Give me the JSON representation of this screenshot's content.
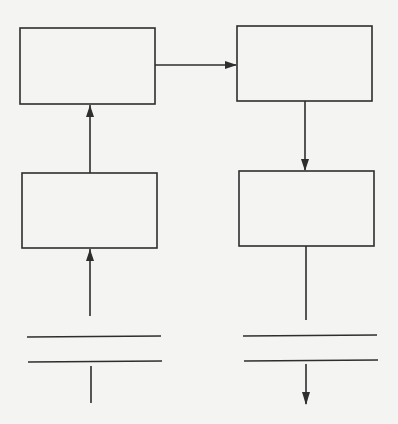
{
  "diagram": {
    "type": "block-flow",
    "stroke_color": "#2e2e2e",
    "background_color": "#f4f4f3",
    "blocks": [
      {
        "id": "block-top-left",
        "label": "",
        "x": 20,
        "y": 28,
        "w": 135,
        "h": 76
      },
      {
        "id": "block-top-right",
        "label": "",
        "x": 237,
        "y": 26,
        "w": 135,
        "h": 75
      },
      {
        "id": "block-bottom-left",
        "label": "",
        "x": 22,
        "y": 173,
        "w": 135,
        "h": 75
      },
      {
        "id": "block-bottom-right",
        "label": "",
        "x": 239,
        "y": 171,
        "w": 135,
        "h": 75
      }
    ],
    "plates": [
      {
        "id": "plate-left",
        "x1": 27,
        "x2": 161,
        "y_top": 337,
        "y_bottom": 362
      },
      {
        "id": "plate-right",
        "x1": 243,
        "x2": 377,
        "y_top": 335,
        "y_bottom": 360
      }
    ],
    "connections": [
      {
        "from": "input-left",
        "to": "block-bottom-left",
        "arrow": true
      },
      {
        "from": "block-bottom-left",
        "to": "block-top-left",
        "arrow": true
      },
      {
        "from": "block-top-left",
        "to": "block-top-right",
        "arrow": true
      },
      {
        "from": "block-top-right",
        "to": "block-bottom-right",
        "arrow": true
      },
      {
        "from": "block-bottom-right",
        "to": "plate-right",
        "arrow": false
      },
      {
        "from": "plate-right",
        "to": "output-right",
        "arrow": true
      }
    ]
  }
}
